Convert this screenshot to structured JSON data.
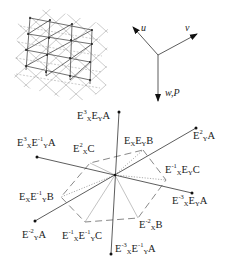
{
  "figure": {
    "lattice_panel": {
      "description": "tiled lattice of rotated squares with triangular grid overlay"
    },
    "axes_panel": {
      "axes": [
        {
          "id": "u",
          "label": "u"
        },
        {
          "id": "v",
          "label": "v"
        },
        {
          "id": "wP",
          "label": "w,P"
        }
      ]
    },
    "star_diagram": {
      "spokes": [
        {
          "id": "s1",
          "label_parts": [
            "E",
            "X",
            "3",
            "E",
            "Y",
            "",
            "A"
          ]
        },
        {
          "id": "s2",
          "label_parts": [
            "E",
            "Y",
            "2",
            "A"
          ]
        },
        {
          "id": "s3",
          "label_parts": [
            "E",
            "X",
            "-3",
            "E",
            "Y",
            "",
            "A"
          ]
        },
        {
          "id": "s4",
          "label_parts": [
            "E",
            "X",
            "-3",
            "E",
            "Y",
            "-1",
            "A"
          ]
        },
        {
          "id": "s5",
          "label_parts": [
            "E",
            "Y",
            "-2",
            "A"
          ]
        },
        {
          "id": "s6",
          "label_parts": [
            "E",
            "X",
            "3",
            "E",
            "Y",
            "-1",
            "A"
          ]
        }
      ],
      "hexagon_vertices": [
        {
          "id": "h1",
          "text": "E_X E_Y B"
        },
        {
          "id": "h2",
          "text": "E_X^-1 E_Y C"
        },
        {
          "id": "h3",
          "text": "E_X^2 B"
        },
        {
          "id": "h4",
          "text": "E_X^-1 E_Y^-1 C"
        },
        {
          "id": "h5",
          "text": "E_X E_Y^-1 B"
        },
        {
          "id": "h6",
          "text": "E_X^2 C"
        }
      ],
      "labels": {
        "top": {
          "E": "E",
          "sub1": "X",
          "sup1": "3",
          "E2": "E",
          "sub2": "Y",
          "end": "A"
        },
        "upper_right": {
          "E": "E",
          "sub1": "Y",
          "sup1": "2",
          "end": "A"
        },
        "right": {
          "E": "E",
          "sub1": "X",
          "sup1": "-3",
          "E2": "E",
          "sub2": "Y",
          "end": "A"
        },
        "bottom": {
          "E": "E",
          "sub1": "X",
          "sup1": "-3",
          "E2": "E",
          "sub2": "Y",
          "sup2": "-1",
          "end": "A"
        },
        "lower_left": {
          "E": "E",
          "sub1": "Y",
          "sup1": "-2",
          "end": "A"
        },
        "left": {
          "E": "E",
          "sub1": "X",
          "sup1": "3",
          "E2": "E",
          "sub2": "Y",
          "sup2": "-1",
          "end": "A"
        },
        "hex_ExEyB": {
          "E": "E",
          "sub1": "X",
          "E2": "E",
          "sub2": "Y",
          "end": "B"
        },
        "hex_Ex-1EyC": {
          "E": "E",
          "sub1": "X",
          "sup1": "-1",
          "E2": "E",
          "sub2": "Y",
          "end": "C"
        },
        "hex_Ex2B": {
          "E": "E",
          "sub1": "X",
          "sup1": "-2",
          "end": "B"
        },
        "hex_Ex-1Ey-1C": {
          "E": "E",
          "sub1": "X",
          "sup1": "-1",
          "E2": "E",
          "sub2": "Y",
          "sup2": "-1",
          "end": "C"
        },
        "hex_ExEy-1B": {
          "E": "E",
          "sub1": "X",
          "E2": "E",
          "sub2": "Y",
          "sup2": "-1",
          "end": "B"
        },
        "hex_Ex2C": {
          "E": "E",
          "sub1": "X",
          "sup1": "2",
          "end": "C"
        }
      }
    },
    "colors": {
      "ink": "#222222",
      "grid": "#888888",
      "background": "#ffffff"
    }
  }
}
